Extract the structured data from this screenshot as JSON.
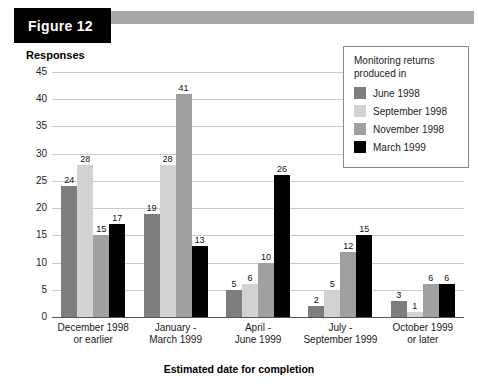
{
  "figure": {
    "tag_label": "Figure 12"
  },
  "legend": {
    "title_line1": "Monitoring returns",
    "title_line2": "produced in",
    "entries": [
      {
        "label": "June 1998",
        "color": "#7d7d7d"
      },
      {
        "label": "September 1998",
        "color": "#d2d2d2"
      },
      {
        "label": "November 1998",
        "color": "#a0a0a0"
      },
      {
        "label": "March 1999",
        "color": "#000000"
      }
    ]
  },
  "chart_data": {
    "type": "bar",
    "title": "Figure 12",
    "xlabel": "Estimated date for completion",
    "ylabel": "Responses",
    "ylim": [
      0,
      45
    ],
    "yticks": [
      0,
      5,
      10,
      15,
      20,
      25,
      30,
      35,
      40,
      45
    ],
    "grid": true,
    "legend_position": "top-right",
    "legend_title": "Monitoring returns produced in",
    "categories": [
      "December 1998 or earlier",
      "January - March 1999",
      "April - June 1999",
      "July - September 1999",
      "October 1999 or later"
    ],
    "category_lines": [
      [
        "December 1998",
        "or earlier"
      ],
      [
        "January -",
        "March 1999"
      ],
      [
        "April -",
        "June 1999"
      ],
      [
        "July -",
        "September 1999"
      ],
      [
        "October 1999",
        "or later"
      ]
    ],
    "series": [
      {
        "name": "June 1998",
        "color": "#7d7d7d",
        "values": [
          24,
          19,
          5,
          2,
          3
        ]
      },
      {
        "name": "September 1998",
        "color": "#d2d2d2",
        "values": [
          28,
          28,
          6,
          5,
          1
        ]
      },
      {
        "name": "November 1998",
        "color": "#a0a0a0",
        "values": [
          15,
          41,
          10,
          12,
          6
        ]
      },
      {
        "name": "March 1999",
        "color": "#000000",
        "values": [
          17,
          13,
          26,
          15,
          6
        ]
      }
    ]
  }
}
